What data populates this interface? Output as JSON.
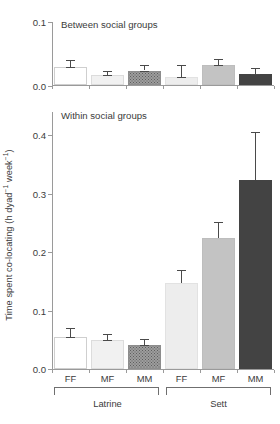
{
  "chart_data": {
    "type": "bar",
    "title": "",
    "ylabel": "Time spent co-locating (h dyad⁻¹ week⁻¹)",
    "xlabel": "",
    "categories": [
      "FF",
      "MF",
      "MM",
      "FF",
      "MF",
      "MM"
    ],
    "group_labels": [
      "Latrine",
      "Sett"
    ],
    "grid": false,
    "legend_position": "none",
    "panels": [
      {
        "name": "between",
        "title": "Between social groups",
        "ylim": [
          0.0,
          0.1
        ],
        "yticks": [
          "0.0",
          "0.1"
        ],
        "ytick_values": [
          0.0,
          0.1
        ],
        "values": [
          0.028,
          0.016,
          0.023,
          0.012,
          0.031,
          0.017
        ],
        "errors": [
          0.012,
          0.006,
          0.009,
          0.019,
          0.01,
          0.01
        ],
        "bars": [
          {
            "category": "FF",
            "group": "Latrine",
            "value": 0.028,
            "error": 0.012,
            "fill": "white"
          },
          {
            "category": "MF",
            "group": "Latrine",
            "value": 0.016,
            "error": 0.006,
            "fill": "verylight"
          },
          {
            "category": "MM",
            "group": "Latrine",
            "value": 0.023,
            "error": 0.009,
            "fill": "stipple"
          },
          {
            "category": "FF",
            "group": "Sett",
            "value": 0.012,
            "error": 0.019,
            "fill": "light"
          },
          {
            "category": "MF",
            "group": "Sett",
            "value": 0.031,
            "error": 0.01,
            "fill": "medium"
          },
          {
            "category": "MM",
            "group": "Sett",
            "value": 0.017,
            "error": 0.01,
            "fill": "dark"
          }
        ]
      },
      {
        "name": "within",
        "title": "Within social groups",
        "ylim": [
          0.0,
          0.44
        ],
        "yticks": [
          "0.0",
          "0.1",
          "0.2",
          "0.3",
          "0.4"
        ],
        "ytick_values": [
          0.0,
          0.1,
          0.2,
          0.3,
          0.4
        ],
        "values": [
          0.055,
          0.049,
          0.041,
          0.148,
          0.224,
          0.323
        ],
        "errors": [
          0.016,
          0.011,
          0.011,
          0.022,
          0.028,
          0.082
        ],
        "bars": [
          {
            "category": "FF",
            "group": "Latrine",
            "value": 0.055,
            "error": 0.016,
            "fill": "white"
          },
          {
            "category": "MF",
            "group": "Latrine",
            "value": 0.049,
            "error": 0.011,
            "fill": "verylight"
          },
          {
            "category": "MM",
            "group": "Latrine",
            "value": 0.041,
            "error": 0.011,
            "fill": "stipple"
          },
          {
            "category": "FF",
            "group": "Sett",
            "value": 0.148,
            "error": 0.022,
            "fill": "light"
          },
          {
            "category": "MF",
            "group": "Sett",
            "value": 0.224,
            "error": 0.028,
            "fill": "medium"
          },
          {
            "category": "MM",
            "group": "Sett",
            "value": 0.323,
            "error": 0.082,
            "fill": "dark"
          }
        ]
      }
    ]
  },
  "panel_top": {
    "title": "Between social groups",
    "tick_0": "0.0",
    "tick_1": "0.1"
  },
  "panel_bottom": {
    "title": "Within social groups",
    "tick_0": "0.0",
    "tick_1": "0.1",
    "tick_2": "0.2",
    "tick_3": "0.3",
    "tick_4": "0.4"
  },
  "axis": {
    "ylabel_main": "Time spent co-locating (h dyad",
    "ylabel_sup1": "−1",
    "ylabel_mid": " week",
    "ylabel_sup2": "−1",
    "ylabel_end": ")"
  },
  "categories": {
    "c0": "FF",
    "c1": "MF",
    "c2": "MM",
    "c3": "FF",
    "c4": "MF",
    "c5": "MM"
  },
  "groups": {
    "g0": "Latrine",
    "g1": "Sett"
  }
}
